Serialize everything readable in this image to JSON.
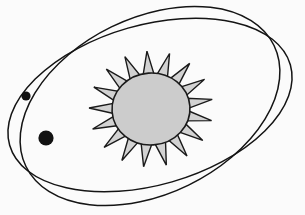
{
  "scene": {
    "title": "Solar System Orbit Diagram",
    "width": 305,
    "height": 215,
    "background_color": "#fbfbfb",
    "line_color": "#141414"
  },
  "sun": {
    "name": "Sun",
    "center_x": 151,
    "center_y": 109,
    "disk_radius_x": 39,
    "disk_radius_y": 36,
    "disk_fill_color": "#cccccc",
    "disk_outline_color": "#1a1a1a",
    "ray_count": 17,
    "ray_fill_color": "#d2d2d2",
    "ray_outline_color": "#1a1a1a",
    "ray_outer_radius_x": 62,
    "ray_outer_radius_y": 58,
    "ray_half_width_deg": 9,
    "rotation_deg": -4
  },
  "orbits": [
    {
      "label": "Outer orbit",
      "center_x": 150,
      "center_y": 105,
      "radius_x": 146,
      "radius_y": 80,
      "rotation_deg": -16,
      "stroke_width": 1.5,
      "stroke_color": "#141414"
    },
    {
      "label": "Inner orbit",
      "center_x": 150,
      "center_y": 106,
      "radius_x": 138,
      "radius_y": 88,
      "rotation_deg": -26,
      "stroke_width": 1.5,
      "stroke_color": "#141414"
    }
  ],
  "planets": [
    {
      "label": "Small planet",
      "center_x": 26,
      "center_y": 96,
      "radius": 4.6,
      "fill_color": "#121212",
      "on_orbit": "Outer orbit"
    },
    {
      "label": "Large planet",
      "center_x": 46,
      "center_y": 138,
      "radius": 7.6,
      "fill_color": "#121212",
      "on_orbit": "Inner orbit"
    }
  ]
}
